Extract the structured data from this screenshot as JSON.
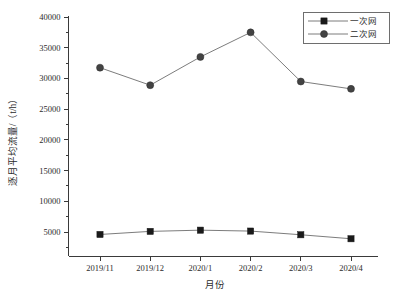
{
  "chart_data": {
    "type": "line",
    "title": "",
    "xlabel": "月份",
    "ylabel": "逐月平均流量/（t/h）",
    "categories": [
      "2019/11",
      "2019/12",
      "2020/1",
      "2020/2",
      "2020/3",
      "2020/4"
    ],
    "series": [
      {
        "name": "一次网",
        "marker": "square",
        "color": "#1a1a1a",
        "values": [
          4600,
          5100,
          5300,
          5150,
          4550,
          3900
        ]
      },
      {
        "name": "二次网",
        "marker": "circle",
        "color": "#434343",
        "values": [
          31750,
          28900,
          33500,
          37500,
          29500,
          28300
        ]
      }
    ],
    "ylim": [
      2000,
      40000
    ],
    "yticks": [
      5000,
      10000,
      15000,
      20000,
      25000,
      30000,
      35000,
      40000
    ],
    "ytick_labels": [
      "5000",
      "10000",
      "15000",
      "20000",
      "25000",
      "30000",
      "35000",
      "40000"
    ],
    "grid": false,
    "legend_position": "top-right",
    "legend_entries": [
      "一次网",
      "二次网"
    ]
  },
  "axes": {
    "y_title": "逐月平均流量/（t/h）",
    "x_title": "月份"
  },
  "legend": {
    "entry_primary": "一次网",
    "entry_secondary": "二次网"
  }
}
